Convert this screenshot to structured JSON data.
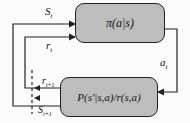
{
  "diagram": {
    "policy_box": {
      "label": "π(a|s)"
    },
    "env_box": {
      "label": "P(s'|s,a)/r(s,a)"
    },
    "labels": {
      "state_t": "S_t",
      "reward_t": "r_t",
      "action_t": "a_t",
      "reward_t1": "r_t+1",
      "state_t1": "S_t+1"
    },
    "colors": {
      "box_fill": "#bdbdbd",
      "line": "#222222"
    }
  }
}
